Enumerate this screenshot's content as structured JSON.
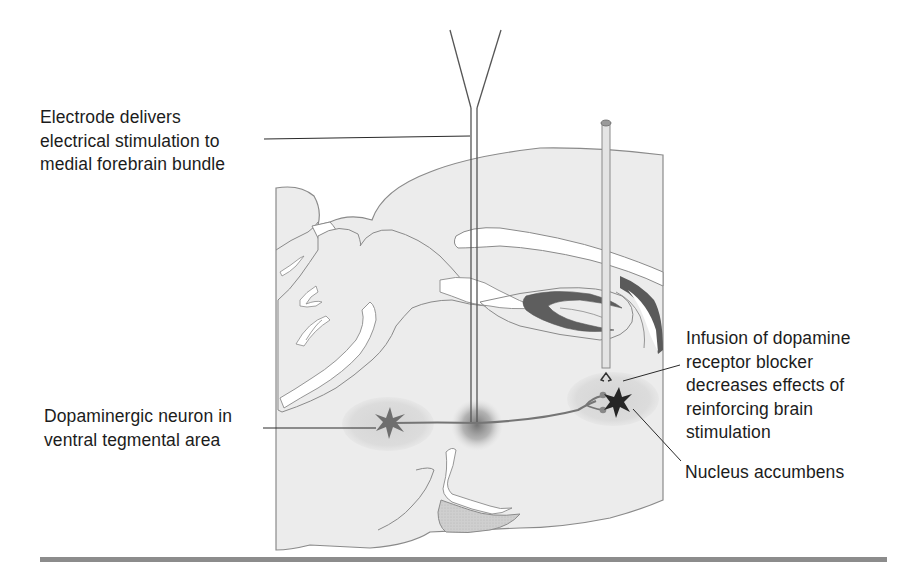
{
  "figure": {
    "labels": {
      "electrode": {
        "lines": [
          "Electrode delivers",
          "electrical stimulation to",
          "medial forebrain bundle"
        ]
      },
      "vta": {
        "lines": [
          "Dopaminergic neuron in",
          "ventral tegmental area"
        ]
      },
      "infusion": {
        "lines": [
          "Infusion of dopamine",
          "receptor blocker",
          "decreases effects of",
          "reinforcing brain",
          "stimulation"
        ]
      },
      "nucleus_accumbens": {
        "lines": [
          "Nucleus accumbens"
        ]
      }
    },
    "elements": {
      "stimulating_electrode": "Y-shaped bipolar electrode inserted vertically into medial forebrain bundle",
      "infusion_cannula": "Vertical cannula with capped top ending above nucleus accumbens",
      "vta_neuron": "Star-shaped dopaminergic neuron in shaded ventral tegmental area",
      "accumbens_neuron": "Dark star-shaped neuron in shaded nucleus accumbens",
      "axon": "Axon running from VTA neuron through stimulation site to nucleus accumbens terminals"
    },
    "colors": {
      "brain_fill": "#ececec",
      "brain_outline": "#8a8a8a",
      "ventricle_fill": "#ffffff",
      "dark_structure": "#5a5a5a",
      "region_shading": "#d9d9d9",
      "neuron_vta": "#707070",
      "neuron_accumbens": "#262626",
      "stimulation_glow": "#7a7a7a",
      "leader_line": "#2a2a2a",
      "bottom_rule": "#8c8c8c"
    }
  }
}
